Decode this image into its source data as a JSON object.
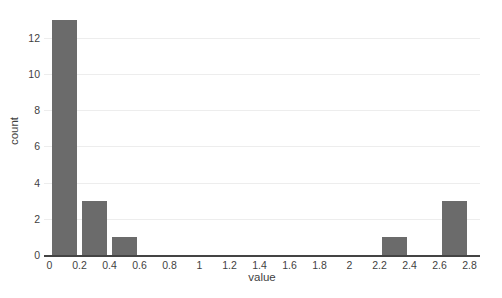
{
  "figure": {
    "background": "#ffffff"
  },
  "chart_data": {
    "type": "bar",
    "subtype": "histogram",
    "title": "",
    "xlabel": "value",
    "ylabel": "count",
    "legend": "none",
    "grid": "horizontal-only",
    "bar_color": "#6b6b6b",
    "grid_color": "#ededed",
    "axis_line_color": "#444444",
    "tick_text_color": "#3f3f3f",
    "xlim": [
      -0.04,
      2.88
    ],
    "ylim": [
      0,
      13.8
    ],
    "x_ticks": [
      {
        "v": 0,
        "label": "0"
      },
      {
        "v": 0.2,
        "label": "0.2"
      },
      {
        "v": 0.4,
        "label": "0.4"
      },
      {
        "v": 0.6,
        "label": "0.6"
      },
      {
        "v": 0.8,
        "label": "0.8"
      },
      {
        "v": 1,
        "label": "1"
      },
      {
        "v": 1.2,
        "label": "1.2"
      },
      {
        "v": 1.4,
        "label": "1.4"
      },
      {
        "v": 1.6,
        "label": "1.6"
      },
      {
        "v": 1.8,
        "label": "1.8"
      },
      {
        "v": 2,
        "label": "2"
      },
      {
        "v": 2.2,
        "label": "2.2"
      },
      {
        "v": 2.4,
        "label": "2.4"
      },
      {
        "v": 2.6,
        "label": "2.6"
      },
      {
        "v": 2.8,
        "label": "2.8"
      }
    ],
    "y_ticks": [
      {
        "v": 0,
        "label": "0"
      },
      {
        "v": 2,
        "label": "2"
      },
      {
        "v": 4,
        "label": "4"
      },
      {
        "v": 6,
        "label": "6"
      },
      {
        "v": 8,
        "label": "8"
      },
      {
        "v": 10,
        "label": "10"
      },
      {
        "v": 12,
        "label": "12"
      }
    ],
    "bins": [
      {
        "start": 0.0,
        "end": 0.2,
        "count": 13
      },
      {
        "start": 0.2,
        "end": 0.4,
        "count": 3
      },
      {
        "start": 0.4,
        "end": 0.6,
        "count": 1
      },
      {
        "start": 2.2,
        "end": 2.4,
        "count": 1
      },
      {
        "start": 2.6,
        "end": 2.8,
        "count": 3
      }
    ]
  }
}
